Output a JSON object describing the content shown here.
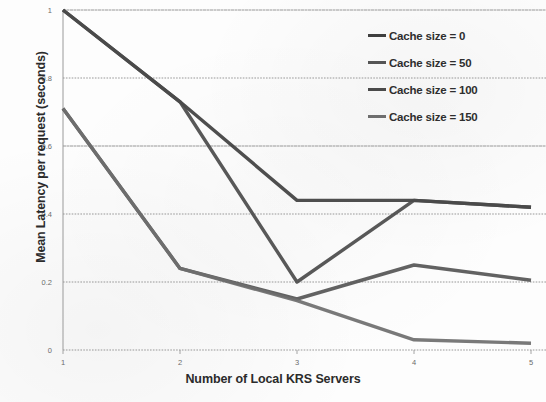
{
  "chart_data": {
    "type": "line",
    "title": "",
    "xlabel": "Number of Local KRS Servers",
    "ylabel": "Mean Latency per request (seconds)",
    "x": [
      1,
      2,
      3,
      4,
      5
    ],
    "xticklabels": [
      "1",
      "2",
      "3",
      "4",
      "5"
    ],
    "yticklabels": [
      "0",
      "0.2",
      "0.4",
      "0.6",
      "0.8",
      "1"
    ],
    "yticks": [
      0,
      0.2,
      0.4,
      0.6,
      0.8,
      1
    ],
    "xlim": [
      1,
      5
    ],
    "ylim": [
      0,
      1
    ],
    "grid": "horizontal-dotted",
    "legend_position": "top-right",
    "series": [
      {
        "name": "Cache size = 0",
        "color": "#3f3f3f",
        "values": [
          1.0,
          0.73,
          0.44,
          0.44,
          0.42
        ]
      },
      {
        "name": "Cache size = 50",
        "color": "#555555",
        "values": [
          0.71,
          0.24,
          0.15,
          0.25,
          0.205
        ]
      },
      {
        "name": "Cache size = 100",
        "color": "#4a4a4a",
        "values": [
          1.0,
          0.73,
          0.2,
          0.44,
          0.42
        ]
      },
      {
        "name": "Cache size = 150",
        "color": "#6e6e6e",
        "values": [
          0.71,
          0.24,
          0.145,
          0.03,
          0.02
        ]
      }
    ]
  },
  "legend": {
    "items": [
      {
        "label": "Cache size = 0",
        "color": "#3f3f3f"
      },
      {
        "label": "Cache size = 50",
        "color": "#555555"
      },
      {
        "label": "Cache size = 100",
        "color": "#4a4a4a"
      },
      {
        "label": "Cache size = 150",
        "color": "#6e6e6e"
      }
    ]
  },
  "axes": {
    "y_title": "Mean Latency per request (seconds)",
    "x_title": "Number of Local KRS Servers"
  }
}
